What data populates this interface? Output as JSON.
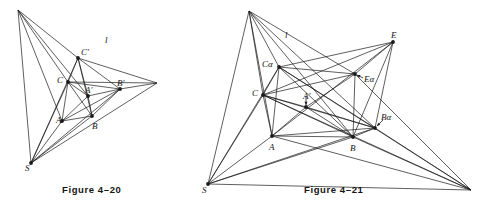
{
  "page": {
    "background": "#ffffff",
    "ink": "#1a1a1a",
    "width": 486,
    "height": 211
  },
  "figures": [
    {
      "id": "figure-4-20",
      "caption": "Figure 4–20",
      "caption_pos": [
        62,
        184
      ],
      "line_label": "l",
      "line_label_pos": [
        105,
        36
      ],
      "points": {
        "V": {
          "x": 18,
          "y": 10,
          "label": "",
          "dot": false
        },
        "Cp": {
          "x": 78,
          "y": 58,
          "label": "C′",
          "lx": 81,
          "ly": 48,
          "dot": true
        },
        "C": {
          "x": 68,
          "y": 82,
          "label": "C",
          "lx": 57,
          "ly": 76,
          "dot": true
        },
        "Ap": {
          "x": 88,
          "y": 96,
          "label": "A′",
          "lx": 85,
          "ly": 86,
          "dot": true
        },
        "Bp": {
          "x": 120,
          "y": 89,
          "label": "B′",
          "lx": 117,
          "ly": 79,
          "dot": true
        },
        "A": {
          "x": 62,
          "y": 121,
          "label": "A",
          "lx": 56,
          "ly": 116,
          "dot": true
        },
        "B": {
          "x": 92,
          "y": 116,
          "label": "B",
          "lx": 92,
          "ly": 122,
          "dot": true
        },
        "S": {
          "x": 31,
          "y": 163,
          "label": "S",
          "lx": 25,
          "ly": 164,
          "dot": true
        },
        "R": {
          "x": 157,
          "y": 83,
          "label": "",
          "dot": false
        }
      },
      "segments": [
        [
          "V",
          "Cp"
        ],
        [
          "V",
          "C"
        ],
        [
          "V",
          "A"
        ],
        [
          "V",
          "Ap"
        ],
        [
          "V",
          "S"
        ],
        [
          "Cp",
          "C"
        ],
        [
          "Cp",
          "Ap"
        ],
        [
          "Cp",
          "B"
        ],
        [
          "Cp",
          "R"
        ],
        [
          "C",
          "A"
        ],
        [
          "C",
          "Ap"
        ],
        [
          "C",
          "B"
        ],
        [
          "C",
          "Bp"
        ],
        [
          "C",
          "R"
        ],
        [
          "Ap",
          "Bp"
        ],
        [
          "Ap",
          "A"
        ],
        [
          "Ap",
          "B"
        ],
        [
          "A",
          "B"
        ],
        [
          "A",
          "Bp"
        ],
        [
          "A",
          "S"
        ],
        [
          "B",
          "Bp"
        ],
        [
          "B",
          "S"
        ],
        [
          "Bp",
          "R"
        ],
        [
          "S",
          "Bp"
        ],
        [
          "S",
          "C"
        ],
        [
          "S",
          "Cp"
        ],
        [
          "S",
          "R"
        ],
        [
          "Cp",
          "Bp"
        ]
      ]
    },
    {
      "id": "figure-4-21",
      "caption": "Figure 4–21",
      "caption_pos": [
        304,
        184
      ],
      "line_label": "l",
      "line_label_pos": [
        285,
        31
      ],
      "points": {
        "T": {
          "x": 249,
          "y": 11,
          "label": "",
          "dot": false
        },
        "E": {
          "x": 393,
          "y": 42,
          "label": "E",
          "lx": 391,
          "ly": 31,
          "dot": true
        },
        "Ca": {
          "x": 279,
          "y": 67,
          "label": "Cα",
          "lx": 262,
          "ly": 60,
          "dot": true
        },
        "Ea": {
          "x": 355,
          "y": 74,
          "label": "Eα",
          "lx": 364,
          "ly": 75,
          "dot": true
        },
        "C": {
          "x": 263,
          "y": 95,
          "label": "C",
          "lx": 252,
          "ly": 89,
          "dot": true
        },
        "Ap": {
          "x": 306,
          "y": 107,
          "label": "A′",
          "lx": 303,
          "ly": 92,
          "dot": true
        },
        "Ba": {
          "x": 375,
          "y": 128,
          "label": "Bα",
          "lx": 381,
          "ly": 113,
          "dot": true
        },
        "A": {
          "x": 272,
          "y": 136,
          "label": "A",
          "lx": 269,
          "ly": 143,
          "dot": true
        },
        "B": {
          "x": 353,
          "y": 137,
          "label": "B",
          "lx": 350,
          "ly": 144,
          "dot": true
        },
        "S": {
          "x": 208,
          "y": 184,
          "label": "S",
          "lx": 202,
          "ly": 186,
          "dot": true
        },
        "R": {
          "x": 471,
          "y": 190,
          "label": "",
          "dot": false
        }
      },
      "segments": [
        [
          "T",
          "Ca"
        ],
        [
          "T",
          "C"
        ],
        [
          "T",
          "A"
        ],
        [
          "T",
          "S"
        ],
        [
          "T",
          "Ea"
        ],
        [
          "T",
          "B"
        ],
        [
          "T",
          "Ba"
        ],
        [
          "E",
          "Ca"
        ],
        [
          "E",
          "Ea"
        ],
        [
          "E",
          "C"
        ],
        [
          "E",
          "B"
        ],
        [
          "E",
          "Ba"
        ],
        [
          "E",
          "A"
        ],
        [
          "Ca",
          "Ea"
        ],
        [
          "Ca",
          "C"
        ],
        [
          "Ca",
          "A"
        ],
        [
          "Ca",
          "B"
        ],
        [
          "Ca",
          "Ba"
        ],
        [
          "Ca",
          "R"
        ],
        [
          "C",
          "Ap"
        ],
        [
          "C",
          "A"
        ],
        [
          "C",
          "B"
        ],
        [
          "C",
          "Ba"
        ],
        [
          "C",
          "Ea"
        ],
        [
          "C",
          "R"
        ],
        [
          "Ap",
          "Ea"
        ],
        [
          "Ap",
          "Ba"
        ],
        [
          "Ap",
          "B"
        ],
        [
          "Ap",
          "A"
        ],
        [
          "A",
          "B"
        ],
        [
          "A",
          "Ba"
        ],
        [
          "A",
          "R"
        ],
        [
          "B",
          "Ba"
        ],
        [
          "B",
          "Ea"
        ],
        [
          "B",
          "R"
        ],
        [
          "Ba",
          "R"
        ],
        [
          "Ea",
          "R"
        ],
        [
          "S",
          "Ca"
        ],
        [
          "S",
          "C"
        ],
        [
          "S",
          "A"
        ],
        [
          "S",
          "B"
        ],
        [
          "S",
          "R"
        ],
        [
          "S",
          "Ba"
        ]
      ],
      "arrows": [
        {
          "name": "arrow-to-E-alpha",
          "from": [
            363,
            78
          ],
          "to": [
            357,
            75
          ]
        },
        {
          "name": "arrow-to-A-prime",
          "from": [
            306,
            96
          ],
          "to": [
            306,
            105
          ]
        },
        {
          "name": "arrow-to-B-alpha",
          "from": [
            383,
            120
          ],
          "to": [
            377,
            126
          ]
        }
      ]
    }
  ]
}
